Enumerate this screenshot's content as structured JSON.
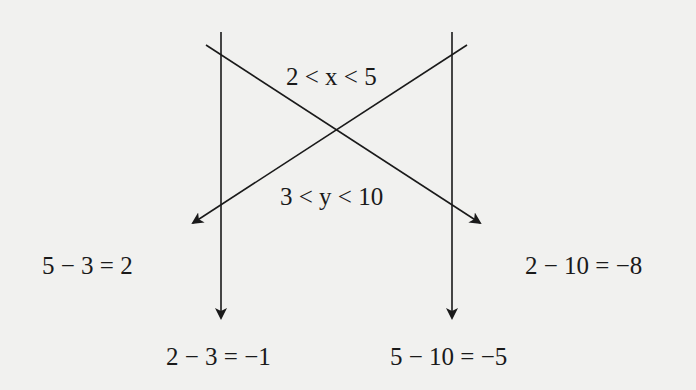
{
  "diagram": {
    "labels": {
      "x_range": "2 < x < 5",
      "y_range": "3 < y < 10",
      "left_mid": "5 − 3 = 2",
      "right_mid": "2 − 10 = −8",
      "bottom_left": "2 − 3 = −1",
      "bottom_right": "5 − 10 = −5"
    },
    "arrows": [
      {
        "from": "x=2",
        "to": "y=3",
        "result": "2 − 3 = −1",
        "direction": "vertical-left"
      },
      {
        "from": "x=5",
        "to": "y=10",
        "result": "5 − 10 = −5",
        "direction": "vertical-right"
      },
      {
        "from": "x=2",
        "to": "y=10",
        "result": "2 − 10 = −8",
        "direction": "diagonal-down-right"
      },
      {
        "from": "x=5",
        "to": "y=3",
        "result": "5 − 3 = 2",
        "direction": "diagonal-down-left"
      }
    ],
    "colors": {
      "background": "#f1f1ef",
      "ink": "#1a1a1a"
    }
  }
}
